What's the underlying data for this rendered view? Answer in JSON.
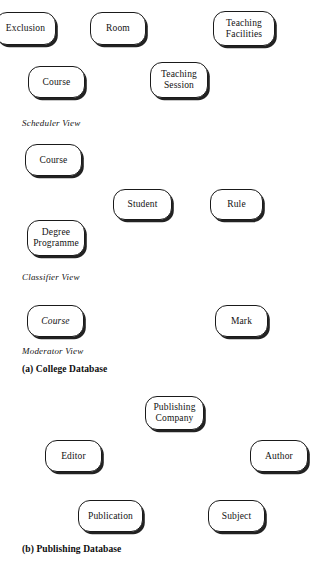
{
  "figure": {
    "background_color": "#ffffff",
    "stroke_color": "#1a1a1a",
    "text_color": "#121212"
  },
  "sections": {
    "college": {
      "caption": "(a) College Database",
      "views": {
        "scheduler": "Scheduler View",
        "classifier": "Classifier View",
        "moderator": "Moderator View"
      }
    },
    "publishing": {
      "caption": "(b) Publishing Database"
    }
  },
  "entities": {
    "scheduler": [
      {
        "label": "Exclusion",
        "style": "normal"
      },
      {
        "label": "Room",
        "style": "normal"
      },
      {
        "label": "Teaching\nFacilities",
        "style": "normal"
      },
      {
        "label": "Course",
        "style": "normal"
      },
      {
        "label": "Teaching\nSession",
        "style": "normal"
      }
    ],
    "classifier": [
      {
        "label": "Course",
        "style": "normal"
      },
      {
        "label": "Student",
        "style": "normal"
      },
      {
        "label": "Rule",
        "style": "normal"
      },
      {
        "label": "Degree\nProgramme",
        "style": "normal"
      }
    ],
    "moderator": [
      {
        "label": "Course",
        "style": "italic"
      },
      {
        "label": "Mark",
        "style": "normal"
      }
    ],
    "publishing": [
      {
        "label": "Publishing\nCompany",
        "style": "normal"
      },
      {
        "label": "Editor",
        "style": "normal"
      },
      {
        "label": "Author",
        "style": "normal"
      },
      {
        "label": "Publication",
        "style": "normal"
      },
      {
        "label": "Subject",
        "style": "normal"
      }
    ]
  }
}
